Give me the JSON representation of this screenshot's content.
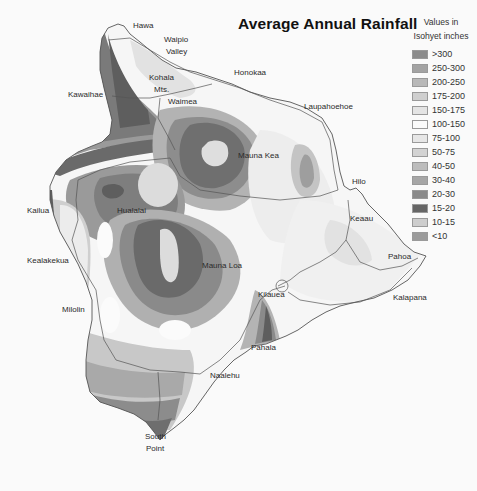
{
  "title": "Average Annual Rainfall",
  "legend": {
    "heading_line1": "Values in",
    "heading_line2": "Isohyet inches",
    "items": [
      {
        "label": ">300",
        "color": "#8c8c8c"
      },
      {
        "label": "250-300",
        "color": "#a3a3a3"
      },
      {
        "label": "200-250",
        "color": "#b8b8b8"
      },
      {
        "label": "175-200",
        "color": "#cfcfcf"
      },
      {
        "label": "150-175",
        "color": "#e4e4e4"
      },
      {
        "label": "100-150",
        "color": "#fbfbfb"
      },
      {
        "label": "75-100",
        "color": "#e6e6e6"
      },
      {
        "label": "50-75",
        "color": "#d3d3d3"
      },
      {
        "label": "40-50",
        "color": "#bcbcbc"
      },
      {
        "label": "30-40",
        "color": "#a6a6a6"
      },
      {
        "label": "20-30",
        "color": "#8a8a8a"
      },
      {
        "label": "15-20",
        "color": "#666666"
      },
      {
        "label": "10-15",
        "color": "#cdcdcd"
      },
      {
        "label": "<10",
        "color": "#9b9b9b"
      }
    ]
  },
  "places": {
    "hawa": "Hawa",
    "waipio_1": "Waipio",
    "waipio_2": "Valley",
    "kohala_1": "Kohala",
    "kohala_2": "Mts.",
    "honokaa": "Honokaa",
    "kawaihae": "Kawaihae",
    "waimea": "Waimea",
    "laupahoehoe": "Laupahoehoe",
    "mauna_kea": "Mauna Kea",
    "hilo": "Hilo",
    "kailua": "Kailua",
    "hualalai": "Hualalai",
    "keaau": "Keaau",
    "pahoa": "Pahoa",
    "kealakekua": "Kealakekua",
    "mauna_loa": "Mauna Loa",
    "kilauea": "Kilauea",
    "kalapana": "Kalapana",
    "milolin": "Milolin",
    "pahala": "Pahala",
    "naalehu": "Naalehu",
    "south_point_1": "South",
    "south_point_2": "Point"
  },
  "chart_data": {
    "type": "heatmap",
    "title": "Average Annual Rainfall",
    "legend_title": "Values in Isohyet inches",
    "bins": [
      ">300",
      "250-300",
      "200-250",
      "175-200",
      "150-175",
      "100-150",
      "75-100",
      "50-75",
      "40-50",
      "30-40",
      "20-30",
      "15-20",
      "10-15",
      "<10"
    ],
    "labeled_locations": [
      "Hawa",
      "Waipio Valley",
      "Kohala Mts.",
      "Honokaa",
      "Kawaihae",
      "Waimea",
      "Laupahoehoe",
      "Mauna Kea",
      "Hilo",
      "Kailua",
      "Hualalai",
      "Keaau",
      "Pahoa",
      "Kealakekua",
      "Mauna Loa",
      "Kilauea",
      "Kalapana",
      "Milolin",
      "Pahala",
      "Naalehu",
      "South Point"
    ]
  }
}
